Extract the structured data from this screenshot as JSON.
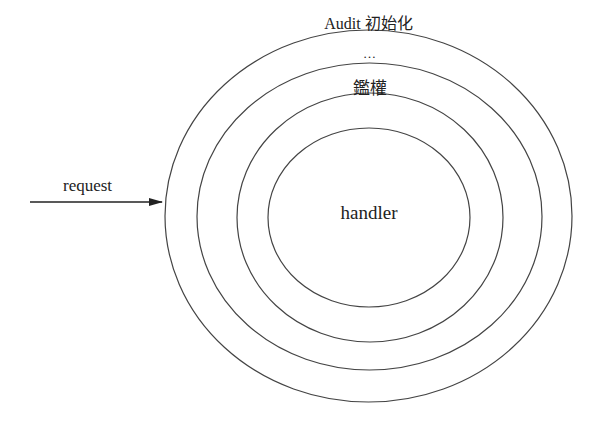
{
  "diagram": {
    "type": "concentric-layers",
    "stroke_color": "#444444",
    "text_color": "#222222",
    "input": {
      "label": "request",
      "arrow": {
        "x1": 30,
        "y1": 202,
        "x2": 162,
        "y2": 202
      }
    },
    "layers": [
      {
        "label": "Audit 初始化",
        "cx": 368.5,
        "cy": 216,
        "rx": 203.5,
        "ry": 186,
        "label_y": 29
      },
      {
        "label": "…",
        "cx": 369.5,
        "cy": 216.5,
        "rx": 172.5,
        "ry": 153.5,
        "label_y": 58
      },
      {
        "label": "鑑權",
        "cx": 370,
        "cy": 217.5,
        "rx": 133,
        "ry": 124.5,
        "label_y": 94
      },
      {
        "label": "handler",
        "cx": 369,
        "cy": 217.5,
        "rx": 101,
        "ry": 89.5,
        "label_y": 219
      }
    ]
  }
}
